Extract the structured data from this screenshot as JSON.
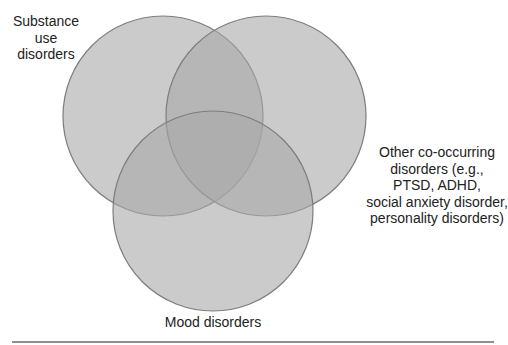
{
  "diagram": {
    "type": "venn",
    "sets": [
      {
        "id": "substance",
        "label_lines": [
          "Substance",
          "use",
          "disorders"
        ],
        "cx": 163,
        "cy": 116,
        "r": 100
      },
      {
        "id": "other",
        "label_lines": [
          "Other co-occurring",
          "disorders (e.g.,",
          "PTSD, ADHD,",
          "social anxiety disorder,",
          "personality disorders)"
        ],
        "cx": 266,
        "cy": 116,
        "r": 100
      },
      {
        "id": "mood",
        "label_lines": [
          "Mood disorders"
        ],
        "cx": 213,
        "cy": 211,
        "r": 100
      }
    ],
    "colors": {
      "fill": "#a8a8a8",
      "fill_opacity": 0.6,
      "stroke": "#7d7d7d",
      "rule": "#8f8f8f"
    }
  }
}
